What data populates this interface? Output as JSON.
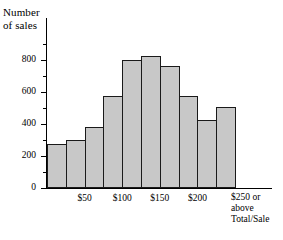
{
  "chart_data": {
    "type": "bar",
    "title": "",
    "subtitle": "",
    "xlabel": "Total/Sale",
    "ylabel": "Number of sales",
    "ylim": [
      0,
      900
    ],
    "grid": false,
    "legend": null,
    "bar_style": "histogram",
    "categories": [
      "0-25",
      "25-50",
      "50-75",
      "75-100",
      "100-125",
      "125-150",
      "150-175",
      "175-200",
      "200-225",
      "225-250"
    ],
    "values": [
      275,
      300,
      380,
      575,
      800,
      825,
      760,
      575,
      425,
      505
    ],
    "y_tick_labels": [
      "0",
      "200",
      "400",
      "600",
      "800"
    ],
    "y_tick_values": [
      0,
      200,
      400,
      600,
      800
    ],
    "y_minor_tick_values": [
      100,
      300,
      500,
      700,
      900
    ],
    "x_tick_labels": [
      "$50",
      "$100",
      "$150",
      "$200",
      "$250 or\nabove"
    ],
    "x_tick_values": [
      50,
      100,
      150,
      200,
      250
    ],
    "x_last_label_text": "$250 or\nabove\nTotal/Sale",
    "colors": {
      "bar_fill": "#c8c8c8",
      "bar_stroke": "#1a1a1a",
      "axis": "#000000",
      "text": "#000000",
      "background": "#ffffff"
    }
  },
  "axis": {
    "y_title": "Number\nof sales"
  }
}
